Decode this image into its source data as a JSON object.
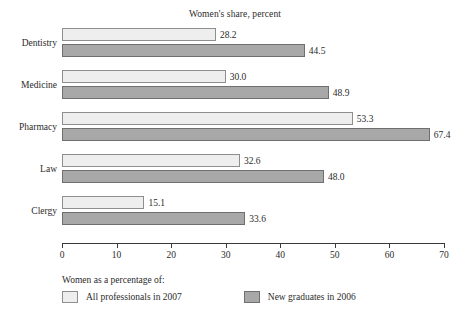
{
  "chart_data": {
    "type": "bar",
    "orientation": "horizontal",
    "title": "Women's share, percent",
    "xlabel": "",
    "ylabel": "",
    "xlim": [
      0,
      70
    ],
    "xticks": [
      0,
      10,
      20,
      30,
      40,
      50,
      60,
      70
    ],
    "grid": false,
    "legend_position": "bottom-left",
    "legend_caption": "Women as a percentage of:",
    "categories": [
      "Dentistry",
      "Medicine",
      "Pharmacy",
      "Law",
      "Clergy"
    ],
    "series": [
      {
        "name": "All professionals in 2007",
        "color": "#eeeeee",
        "values": [
          28.2,
          30.0,
          53.3,
          32.6,
          15.1
        ],
        "labels": [
          "28.2",
          "30.0",
          "53.3",
          "32.6",
          "15.1"
        ]
      },
      {
        "name": "New graduates in 2006",
        "color": "#a8a8a8",
        "values": [
          44.5,
          48.9,
          67.4,
          48.0,
          33.6
        ],
        "labels": [
          "44.5",
          "48.9",
          "67.4",
          "48.0",
          "33.6"
        ]
      }
    ]
  }
}
